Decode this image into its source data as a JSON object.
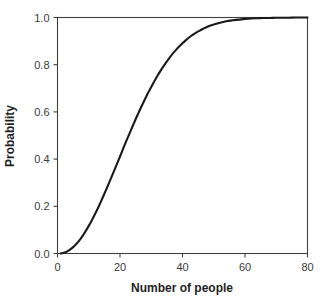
{
  "chart_data": {
    "type": "line",
    "title": "",
    "subtitle": "",
    "xlabel": "Number of people",
    "ylabel": "Probability",
    "xlim": [
      0,
      80
    ],
    "ylim": [
      0.0,
      1.0
    ],
    "grid": false,
    "legend": null,
    "legend_position": "none",
    "xticks": [
      0,
      20,
      40,
      60,
      80
    ],
    "xtick_labels": [
      "0",
      "20",
      "40",
      "60",
      "80"
    ],
    "yticks": [
      0.0,
      0.2,
      0.4,
      0.6,
      0.8,
      1.0
    ],
    "ytick_labels": [
      "0.0",
      "0.2",
      "0.4",
      "0.6",
      "0.8",
      "1.0"
    ],
    "line_color": "#1a1a1a",
    "axis_color": "#404040",
    "background_color": "#ffffff",
    "series": [
      {
        "name": "Shared birthday probability",
        "x": [
          1,
          2,
          3,
          4,
          5,
          6,
          7,
          8,
          9,
          10,
          11,
          12,
          13,
          14,
          15,
          16,
          17,
          18,
          19,
          20,
          21,
          22,
          23,
          24,
          25,
          26,
          27,
          28,
          29,
          30,
          31,
          32,
          33,
          34,
          35,
          36,
          37,
          38,
          39,
          40,
          41,
          42,
          43,
          44,
          45,
          46,
          47,
          48,
          49,
          50,
          52,
          54,
          56,
          58,
          60,
          62,
          64,
          66,
          68,
          70,
          72,
          74,
          76,
          78,
          80
        ],
        "values": [
          0.0,
          0.003,
          0.008,
          0.016,
          0.027,
          0.04,
          0.056,
          0.074,
          0.095,
          0.117,
          0.141,
          0.167,
          0.194,
          0.223,
          0.253,
          0.284,
          0.315,
          0.347,
          0.379,
          0.411,
          0.444,
          0.476,
          0.507,
          0.538,
          0.569,
          0.598,
          0.627,
          0.654,
          0.681,
          0.706,
          0.73,
          0.753,
          0.775,
          0.795,
          0.814,
          0.832,
          0.849,
          0.864,
          0.878,
          0.891,
          0.903,
          0.914,
          0.924,
          0.933,
          0.941,
          0.948,
          0.955,
          0.961,
          0.966,
          0.97,
          0.978,
          0.984,
          0.988,
          0.991,
          0.994,
          0.996,
          0.997,
          0.998,
          0.998,
          0.999,
          0.999,
          0.999,
          1.0,
          1.0,
          1.0
        ]
      }
    ]
  },
  "axes": {
    "x_title": "Number of people",
    "y_title": "Probability"
  }
}
